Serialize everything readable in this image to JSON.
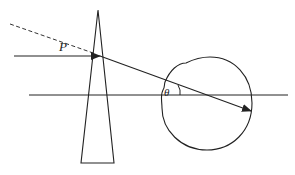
{
  "diagram": {
    "type": "optics-ray-diagram",
    "labels": {
      "incident_point": "P",
      "angle": "θ"
    },
    "elements": {
      "prism": {
        "description": "thin tall triangle/wedge prism",
        "apex": [
          98,
          10
        ],
        "base_left": [
          81,
          163
        ],
        "base_right": [
          114,
          163
        ]
      },
      "incident_ray": {
        "description": "horizontal ray entering prism",
        "from": [
          14,
          56
        ],
        "to": [
          100,
          56
        ]
      },
      "dashed_ray": {
        "description": "dashed extension line",
        "from": [
          10,
          24
        ],
        "to": [
          97,
          55
        ]
      },
      "refracted_ray": {
        "description": "deviated ray with arrowhead",
        "from": [
          100,
          56
        ],
        "to": [
          251,
          111
        ]
      },
      "axis_line": {
        "description": "horizontal reference line",
        "from": [
          29,
          95
        ],
        "to": [
          288,
          95
        ]
      },
      "eye_outline": {
        "description": "roughly circular blob outline",
        "center": [
          207,
          104
        ],
        "radius": 46
      }
    },
    "colors": {
      "stroke": "#222222",
      "background": "#ffffff"
    }
  }
}
